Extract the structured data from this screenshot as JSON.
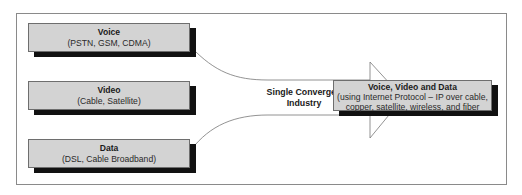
{
  "diagram": {
    "type": "convergence",
    "sources": [
      {
        "title": "Voice",
        "subtitle": "(PSTN, GSM, CDMA)"
      },
      {
        "title": "Video",
        "subtitle": "(Cable, Satellite)"
      },
      {
        "title": "Data",
        "subtitle": "(DSL, Cable Broadband)"
      }
    ],
    "arrow_label_line1": "Single Converged",
    "arrow_label_line2": "Industry",
    "target": {
      "title": "Voice, Video and Data",
      "subtitle_line1": "(using Internet Protocol – IP over cable,",
      "subtitle_line2": "copper, satellite, wireless, and fiber"
    },
    "colors": {
      "box_fill": "#d3d3d3",
      "shadow": "#111111",
      "frame": "#8a8a8a"
    }
  }
}
